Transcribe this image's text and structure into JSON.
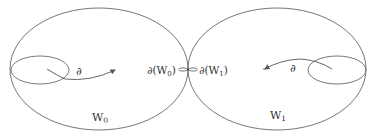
{
  "diagram": {
    "regions": [
      {
        "id": "W0",
        "label_base": "W",
        "label_sub": "0",
        "boundary_label": "∂(W",
        "boundary_sub": "0",
        "boundary_close": ")"
      },
      {
        "id": "W1",
        "label_base": "W",
        "label_sub": "1",
        "boundary_label": "∂(W",
        "boundary_sub": "1",
        "boundary_close": ")"
      }
    ],
    "arrows": [
      {
        "from": "left-loop",
        "label": "∂"
      },
      {
        "from": "right-loop",
        "label": "∂"
      }
    ],
    "colors": {
      "stroke": "#555555",
      "text": "#333333",
      "background": "#ffffff"
    }
  }
}
